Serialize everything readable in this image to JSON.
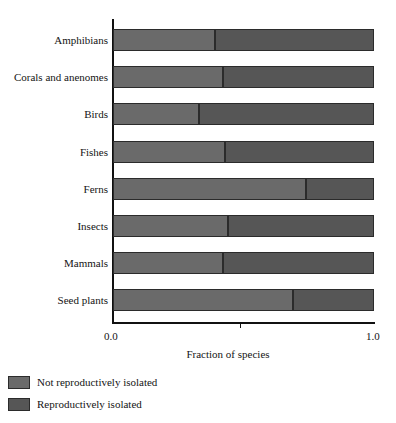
{
  "chart_data": {
    "type": "bar",
    "orientation": "horizontal",
    "stacked": true,
    "normalized": true,
    "title": "",
    "xlabel": "Fraction of species",
    "ylabel": "",
    "xlim": [
      0.0,
      1.0
    ],
    "xticks": [
      0.0,
      1.0
    ],
    "xtick_labels": [
      "0.0",
      "1.0"
    ],
    "grid": false,
    "legend_position": "below-left",
    "categories": [
      "Amphibians",
      "Corals and anenomes",
      "Birds",
      "Fishes",
      "Ferns",
      "Insects",
      "Mammals",
      "Seed plants"
    ],
    "series": [
      {
        "name": "Not reproductively isolated",
        "color": "#6a6a6a",
        "values": [
          0.39,
          0.42,
          0.33,
          0.43,
          0.74,
          0.44,
          0.42,
          0.69
        ]
      },
      {
        "name": "Reproductively isolated",
        "color": "#565656",
        "values": [
          0.61,
          0.58,
          0.67,
          0.57,
          0.26,
          0.56,
          0.58,
          0.31
        ]
      }
    ]
  },
  "legend": {
    "items": [
      {
        "label": "Not reproductively isolated",
        "color": "#6a6a6a"
      },
      {
        "label": "Reproductively isolated",
        "color": "#565656"
      }
    ]
  },
  "axis": {
    "x_title": "Fraction of species",
    "x_tick_min": "0.0",
    "x_tick_max": "1.0"
  },
  "colors": {
    "segment_not_isolated": "#6a6a6a",
    "segment_isolated": "#565656",
    "outline": "#2b2b2b",
    "axis": "#111111",
    "background": "#ffffff",
    "text": "#141414"
  }
}
